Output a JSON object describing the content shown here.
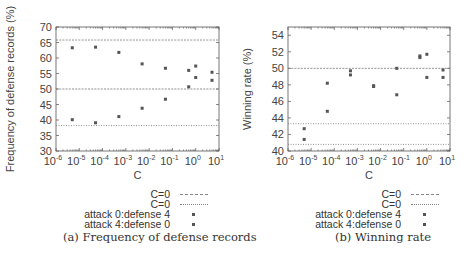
{
  "chart_data": [
    {
      "type": "scatter",
      "title": "",
      "caption": "(a) Frequency of defense records",
      "xlabel": "C",
      "ylabel": "Frequency of defense records (%)",
      "xscale": "log",
      "xlim": [
        1e-06,
        10
      ],
      "ylim": [
        30,
        70
      ],
      "xticks": [
        "10^-6",
        "10^-5",
        "10^-4",
        "10^-3",
        "10^-2",
        "10^-1",
        "10^0",
        "10^1"
      ],
      "yticks": [
        30,
        35,
        40,
        45,
        50,
        55,
        60,
        65,
        70
      ],
      "grid": false,
      "legend_position": "below",
      "reference_lines": [
        {
          "name": "C=0",
          "y": 65.8,
          "style": "dashed"
        },
        {
          "name": "C=0",
          "y": 50.0,
          "style": "dashed"
        },
        {
          "name": "C=0",
          "y": 38.2,
          "style": "dotted"
        }
      ],
      "x": [
        5e-06,
        5e-05,
        0.0005,
        0.005,
        0.05,
        0.5,
        1,
        5
      ],
      "series": [
        {
          "name": "attack 0:defense 4",
          "values": [
            63.3,
            63.5,
            61.8,
            58.1,
            56.7,
            56.0,
            57.4,
            55.4
          ]
        },
        {
          "name": "attack 4:defense 0",
          "values": [
            40.1,
            39.1,
            41.1,
            43.8,
            46.7,
            50.7,
            53.7,
            52.8
          ]
        }
      ]
    },
    {
      "type": "scatter",
      "title": "",
      "caption": "(b) Winning rate",
      "xlabel": "C",
      "ylabel": "Winning rate (%)",
      "xscale": "log",
      "xlim": [
        1e-06,
        10
      ],
      "ylim": [
        40,
        55
      ],
      "xticks": [
        "10^-6",
        "10^-5",
        "10^-4",
        "10^-3",
        "10^-2",
        "10^-1",
        "10^0",
        "10^1"
      ],
      "yticks": [
        40,
        42,
        44,
        46,
        48,
        50,
        52,
        54
      ],
      "grid": false,
      "legend_position": "below",
      "reference_lines": [
        {
          "name": "C=0",
          "y": 50.0,
          "style": "dashed"
        },
        {
          "name": "C=0",
          "y": 43.3,
          "style": "dotted"
        },
        {
          "name": "C=0",
          "y": 40.8,
          "style": "dotted"
        }
      ],
      "x": [
        5e-06,
        5e-05,
        0.0005,
        0.005,
        0.05,
        0.5,
        1,
        5
      ],
      "series": [
        {
          "name": "attack 0:defense 4",
          "values": [
            42.7,
            48.2,
            49.7,
            47.9,
            50.0,
            51.5,
            51.7,
            49.8
          ]
        },
        {
          "name": "attack 4:defense 0",
          "values": [
            41.4,
            44.8,
            49.2,
            47.8,
            46.8,
            51.3,
            48.9,
            48.9
          ]
        }
      ]
    }
  ],
  "panels": [
    {
      "ylabel": "Frequency of defense records (%)",
      "xlabel": "C",
      "legend": [
        "C=0",
        "C=0",
        "attack 0:defense 4",
        "attack 4:defense 0"
      ],
      "caption": "(a) Frequency of defense records"
    },
    {
      "ylabel": "Winning rate (%)",
      "xlabel": "C",
      "legend": [
        "C=0",
        "C=0",
        "attack 0:defense 4",
        "attack 4:defense 0"
      ],
      "caption": "(b) Winning rate"
    }
  ],
  "colors": {
    "axis": "#555555",
    "marker": "#555555",
    "reference_line": "#777777",
    "text": "#333333"
  }
}
